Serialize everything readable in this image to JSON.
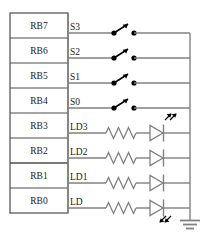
{
  "diagram": {
    "colors": {
      "wire": "#808080",
      "box_border": "#4d4d4d",
      "symbol": "#666666",
      "dot": "#000000",
      "text": "#1a1a1a",
      "background": "#ffffff"
    },
    "port_block": {
      "name": "port-b-block",
      "pins": [
        {
          "label": "RB7",
          "net": "S3",
          "type": "switch"
        },
        {
          "label": "RB6",
          "net": "S2",
          "type": "switch"
        },
        {
          "label": "RB5",
          "net": "S1",
          "type": "switch"
        },
        {
          "label": "RB4",
          "net": "S0",
          "type": "switch"
        },
        {
          "label": "RB3",
          "net": "LD3",
          "type": "led"
        },
        {
          "label": "RB2",
          "net": "LD2",
          "type": "led"
        },
        {
          "label": "RB1",
          "net": "LD1",
          "type": "led"
        },
        {
          "label": "RB0",
          "net": "LD",
          "type": "led"
        }
      ]
    },
    "components": {
      "switch_name": "spst-switch",
      "resistor_name": "resistor",
      "led_name": "led",
      "ground_name": "ground-symbol",
      "bus_name": "common-bus-rail"
    }
  }
}
